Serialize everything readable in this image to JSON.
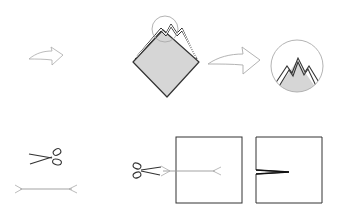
{
  "diagram": {
    "title": "",
    "colors": {
      "stroke_dark": "#333333",
      "stroke_light": "#999999",
      "fill_gray": "#d6d6d6",
      "arrow_stroke": "#aaaaaa",
      "background": "#ffffff"
    },
    "steps": [
      {
        "name": "fold-arrow",
        "description": "outline curved arrow indicating folding step"
      },
      {
        "name": "folded-diamond",
        "description": "gray diamond with multiple folded peaks at top, circled detail"
      },
      {
        "name": "zoom-arrow",
        "description": "outline curved arrow pointing to detail view"
      },
      {
        "name": "detail-circle",
        "description": "magnified view of peaks at top of folded paper"
      },
      {
        "name": "scissors-legend",
        "description": "scissors icon meaning cut"
      },
      {
        "name": "cut-line-legend",
        "description": "line with arrow ends meaning cut line"
      },
      {
        "name": "cut-square",
        "description": "square with scissors cutting along a line from left edge"
      },
      {
        "name": "result-square",
        "description": "square with a narrow slit from left edge"
      }
    ]
  }
}
